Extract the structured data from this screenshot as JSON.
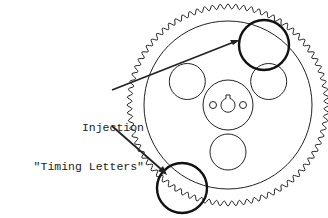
{
  "diagram": {
    "label_line1": "Injection",
    "label_line2": "\"Timing Letters\"",
    "gear": {
      "center": [
        228,
        105
      ],
      "tooth_count": 80,
      "outer_radius": 101,
      "root_radius": 96,
      "inner_ring_radius": 84,
      "hub_radius": 25,
      "window_count": 3,
      "window_radius": 18,
      "window_distance": 47,
      "keyhole_radius": 7,
      "bolt_hole_radius": 3.5
    },
    "highlights": [
      {
        "name": "upper-timing-mark-circle",
        "center": [
          264,
          45
        ],
        "radius": 25
      },
      {
        "name": "lower-timing-mark-circle",
        "center": [
          182,
          188
        ],
        "radius": 25
      }
    ],
    "colors": {
      "line": "#222222",
      "highlight": "#111111",
      "background": "#ffffff"
    }
  }
}
